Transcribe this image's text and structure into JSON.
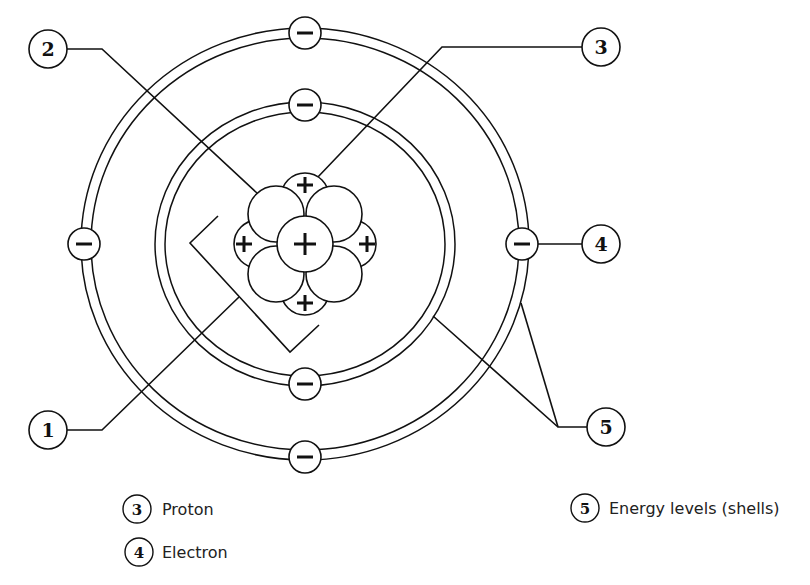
{
  "diagram": {
    "callouts": [
      {
        "id": "1",
        "label": "1"
      },
      {
        "id": "2",
        "label": "2"
      },
      {
        "id": "3",
        "label": "3"
      },
      {
        "id": "4",
        "label": "4"
      },
      {
        "id": "5",
        "label": "5"
      }
    ],
    "nucleus": {
      "proton_sign": "+",
      "proton_count": 5,
      "neutron_count": 4
    },
    "electrons": {
      "sign": "−",
      "outer_shell_count": 4,
      "inner_shell_count": 2
    },
    "legend": [
      {
        "num": "3",
        "text": "Proton"
      },
      {
        "num": "4",
        "text": "Electron"
      },
      {
        "num": "5",
        "text": "Energy levels (shells)"
      }
    ],
    "colors": {
      "line": "#111111",
      "background": "#ffffff"
    }
  }
}
